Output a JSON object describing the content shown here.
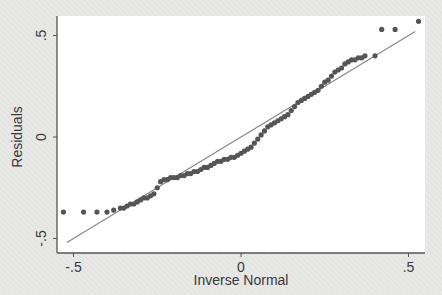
{
  "chart_data": {
    "type": "scatter",
    "title": "",
    "xlabel": "Inverse Normal",
    "ylabel": "Residuals",
    "xlim": [
      -0.55,
      0.55
    ],
    "ylim": [
      -0.57,
      0.6
    ],
    "xticks": [
      -0.5,
      0,
      0.5
    ],
    "xtick_labels": [
      "-.5",
      "0",
      ".5"
    ],
    "yticks": [
      -0.5,
      0,
      0.5
    ],
    "ytick_labels": [
      "-.5",
      "0",
      ".5"
    ],
    "grid": false,
    "legend": null,
    "reference_line": {
      "x": [
        -0.52,
        0.52
      ],
      "y": [
        -0.52,
        0.52
      ],
      "color": "#8a8a8a"
    },
    "series": [
      {
        "name": "Residuals",
        "color": "#555555",
        "points": [
          [
            -0.53,
            -0.37
          ],
          [
            -0.47,
            -0.37
          ],
          [
            -0.43,
            -0.37
          ],
          [
            -0.4,
            -0.37
          ],
          [
            -0.38,
            -0.36
          ],
          [
            -0.36,
            -0.35
          ],
          [
            -0.35,
            -0.35
          ],
          [
            -0.34,
            -0.34
          ],
          [
            -0.33,
            -0.33
          ],
          [
            -0.32,
            -0.33
          ],
          [
            -0.31,
            -0.32
          ],
          [
            -0.3,
            -0.31
          ],
          [
            -0.29,
            -0.3
          ],
          [
            -0.28,
            -0.3
          ],
          [
            -0.27,
            -0.29
          ],
          [
            -0.26,
            -0.28
          ],
          [
            -0.25,
            -0.25
          ],
          [
            -0.24,
            -0.22
          ],
          [
            -0.23,
            -0.21
          ],
          [
            -0.22,
            -0.21
          ],
          [
            -0.21,
            -0.2
          ],
          [
            -0.2,
            -0.2
          ],
          [
            -0.19,
            -0.2
          ],
          [
            -0.18,
            -0.19
          ],
          [
            -0.17,
            -0.19
          ],
          [
            -0.16,
            -0.18
          ],
          [
            -0.15,
            -0.18
          ],
          [
            -0.14,
            -0.17
          ],
          [
            -0.13,
            -0.17
          ],
          [
            -0.12,
            -0.16
          ],
          [
            -0.11,
            -0.15
          ],
          [
            -0.1,
            -0.15
          ],
          [
            -0.09,
            -0.14
          ],
          [
            -0.08,
            -0.13
          ],
          [
            -0.07,
            -0.12
          ],
          [
            -0.06,
            -0.12
          ],
          [
            -0.05,
            -0.11
          ],
          [
            -0.04,
            -0.11
          ],
          [
            -0.03,
            -0.1
          ],
          [
            -0.02,
            -0.1
          ],
          [
            -0.01,
            -0.09
          ],
          [
            0.0,
            -0.08
          ],
          [
            0.01,
            -0.07
          ],
          [
            0.02,
            -0.06
          ],
          [
            0.03,
            -0.05
          ],
          [
            0.04,
            -0.03
          ],
          [
            0.05,
            -0.01
          ],
          [
            0.06,
            0.01
          ],
          [
            0.07,
            0.03
          ],
          [
            0.08,
            0.05
          ],
          [
            0.09,
            0.06
          ],
          [
            0.1,
            0.07
          ],
          [
            0.11,
            0.08
          ],
          [
            0.12,
            0.09
          ],
          [
            0.13,
            0.1
          ],
          [
            0.14,
            0.11
          ],
          [
            0.15,
            0.13
          ],
          [
            0.16,
            0.15
          ],
          [
            0.17,
            0.17
          ],
          [
            0.18,
            0.18
          ],
          [
            0.19,
            0.19
          ],
          [
            0.2,
            0.2
          ],
          [
            0.21,
            0.21
          ],
          [
            0.22,
            0.22
          ],
          [
            0.23,
            0.23
          ],
          [
            0.24,
            0.25
          ],
          [
            0.25,
            0.27
          ],
          [
            0.26,
            0.28
          ],
          [
            0.27,
            0.3
          ],
          [
            0.28,
            0.32
          ],
          [
            0.29,
            0.33
          ],
          [
            0.3,
            0.34
          ],
          [
            0.31,
            0.36
          ],
          [
            0.32,
            0.37
          ],
          [
            0.33,
            0.38
          ],
          [
            0.34,
            0.38
          ],
          [
            0.35,
            0.39
          ],
          [
            0.36,
            0.39
          ],
          [
            0.37,
            0.4
          ],
          [
            0.4,
            0.4
          ],
          [
            0.42,
            0.53
          ],
          [
            0.46,
            0.53
          ],
          [
            0.53,
            0.57
          ]
        ]
      }
    ]
  },
  "axes": {
    "x_title": "Inverse Normal",
    "y_title": "Residuals",
    "x_tick_labels": [
      "-.5",
      "0",
      ".5"
    ],
    "y_tick_labels": [
      ".5",
      "0",
      "-.5"
    ]
  }
}
